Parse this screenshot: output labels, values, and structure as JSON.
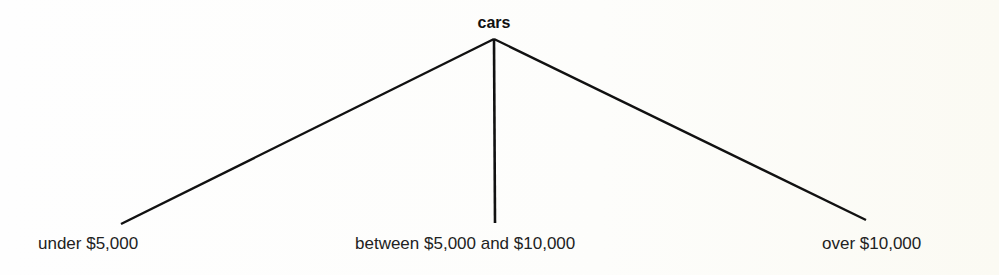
{
  "tree": {
    "root": {
      "label": "cars"
    },
    "children": [
      {
        "label": "under $5,000"
      },
      {
        "label": "between $5,000 and $10,000"
      },
      {
        "label": "over $10,000"
      }
    ]
  },
  "colors": {
    "line": "#111111",
    "text": "#222222",
    "background": "#fdfdfb"
  }
}
